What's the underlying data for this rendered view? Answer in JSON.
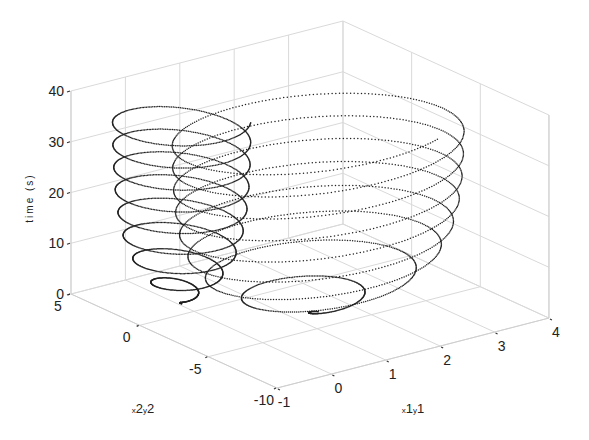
{
  "chart_data": {
    "type": "scatter3d",
    "title": "",
    "xlabel": "x1y1",
    "ylabel": "x2y2",
    "zlabel": "time (s)",
    "x_axis": {
      "name": "x1y1",
      "range": [
        -1,
        4
      ],
      "ticks": [
        -1,
        0,
        1,
        2,
        3,
        4
      ]
    },
    "y_axis": {
      "name": "x2y2",
      "range": [
        -10,
        5
      ],
      "ticks": [
        -10,
        -5,
        0,
        5
      ]
    },
    "z_axis": {
      "name": "time (s)",
      "range": [
        0,
        40
      ],
      "ticks": [
        0,
        10,
        20,
        30,
        40
      ]
    },
    "grid": true,
    "marker": "dot",
    "series": [
      {
        "name": "x1-y1 trajectory",
        "color": "#222222",
        "center": [
          1.45,
          -3.3
        ],
        "radius": [
          2.35,
          5.2
        ],
        "period_s": 4.4,
        "t_range": [
          0,
          37
        ],
        "growth_tau_s": 6.0,
        "phase": 2.6
      },
      {
        "name": "x2-y2 trajectory",
        "color": "#222222",
        "center": [
          0.05,
          1.1
        ],
        "radius": [
          0.95,
          3.4
        ],
        "period_s": 4.4,
        "t_range": [
          0,
          37
        ],
        "growth_tau_s": 7.0,
        "phase": 2.9
      }
    ]
  },
  "labels": {
    "z_ticks": [
      "0",
      "10",
      "20",
      "30",
      "40"
    ],
    "y_ticks": [
      "5",
      "0",
      "-5",
      "-10"
    ],
    "x_ticks": [
      "-1",
      "0",
      "1",
      "2",
      "3",
      "4"
    ],
    "xlabel_main": "x1",
    "xlabel_sub1": "x",
    "xlabel_sub2": "y",
    "ylabel": "time (s)"
  }
}
